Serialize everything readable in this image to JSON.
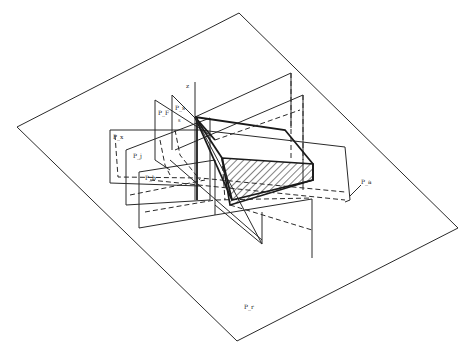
{
  "figure": {
    "type": "3d-geometric-diagram",
    "labels": {
      "axis_z": "z",
      "plane_f": "P_F",
      "plane_s": "P_s",
      "plane_x": "P_x",
      "plane_j": "P_j",
      "plane_b": "P_b",
      "plane_a": "P_a",
      "plane_r": "P_r",
      "edge_s": "s"
    },
    "colors": {
      "line": "#2a2a2a",
      "background": "#ffffff",
      "hatch": "#1a1a1a"
    }
  }
}
